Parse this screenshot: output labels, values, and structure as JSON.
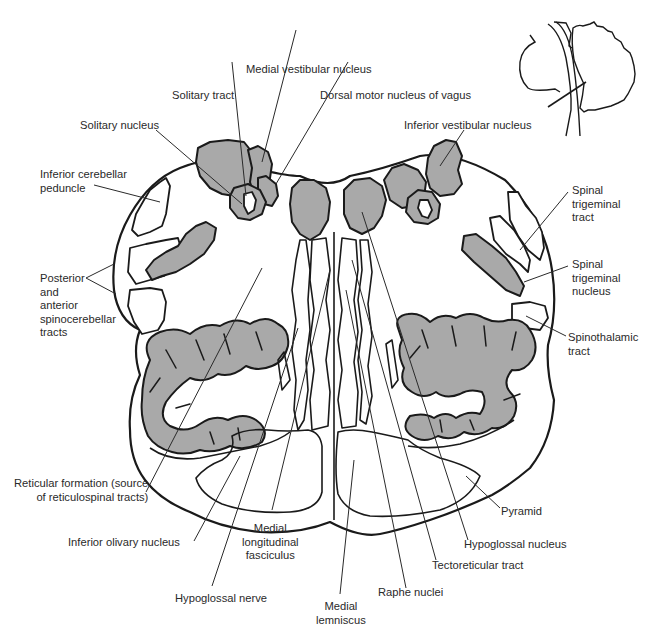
{
  "diagram": {
    "colors": {
      "nucleus_fill": "#a9a9a9",
      "outline": "#1a1a1a",
      "label_text": "#2a2a2a",
      "background": "#ffffff"
    },
    "labels": {
      "medial_vestibular_nucleus": "Medial vestibular nucleus",
      "solitary_tract": "Solitary tract",
      "dorsal_motor_nucleus_of_vagus": "Dorsal motor nucleus of vagus",
      "solitary_nucleus": "Solitary nucleus",
      "inferior_vestibular_nucleus": "Inferior vestibular nucleus",
      "inferior_cerebellar_peduncle": "Inferior cerebellar\npeduncle",
      "spinal_trigeminal_tract": "Spinal\ntrigeminal\ntract",
      "spinal_trigeminal_nucleus": "Spinal\ntrigeminal\nnucleus",
      "posterior_anterior_spinocerebellar": "Posterior\nand\nanterior\nspinocerebellar\ntracts",
      "spinothalamic_tract": "Spinothalamic\ntract",
      "reticular_formation": "Reticular formation (source\nof reticulospinal tracts)",
      "pyramid": "Pyramid",
      "inferior_olivary_nucleus": "Inferior olivary nucleus",
      "hypoglossal_nucleus": "Hypoglossal nucleus",
      "medial_longitudinal_fasciculus": "Medial\nlongitudinal\nfasciculus",
      "tectoreticular_tract": "Tectoreticular tract",
      "hypoglossal_nerve": "Hypoglossal nerve",
      "raphe_nuclei": "Raphe nuclei",
      "medial_lemniscus": "Medial\nlemniscus"
    },
    "inset": {
      "description": "Brainstem and cerebellum sagittal sketch with section-level line"
    }
  }
}
